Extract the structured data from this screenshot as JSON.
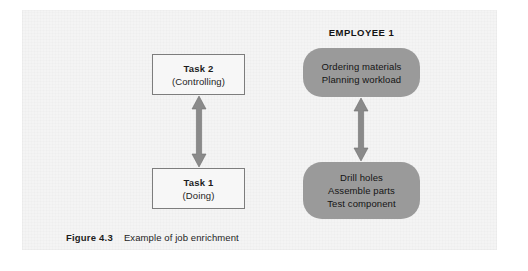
{
  "figure": {
    "caption_label": "Figure 4.3",
    "caption_text": "Example of job enrichment",
    "background_color": "#f4f4f4",
    "page_color": "#ffffff"
  },
  "left_column": {
    "boxes": [
      {
        "title": "Task 2",
        "subtitle": "(Controlling)",
        "border_color": "#7d7d7d",
        "fill_color": "#f7f7f7"
      },
      {
        "title": "Task 1",
        "subtitle": "(Doing)",
        "border_color": "#7d7d7d",
        "fill_color": "#f7f7f7"
      }
    ],
    "connector": {
      "name": "double-headed-vertical-arrow",
      "color": "#8a8a8a"
    }
  },
  "right_column": {
    "heading": "EMPLOYEE 1",
    "boxes": [
      {
        "fill_color": "#9a9a9a",
        "lines": [
          "Ordering materials",
          "Planning workload"
        ]
      },
      {
        "fill_color": "#9a9a9a",
        "lines": [
          "Drill holes",
          "Assemble parts",
          "Test component"
        ]
      }
    ],
    "connector": {
      "name": "double-headed-vertical-arrow",
      "color": "#8a8a8a"
    }
  }
}
